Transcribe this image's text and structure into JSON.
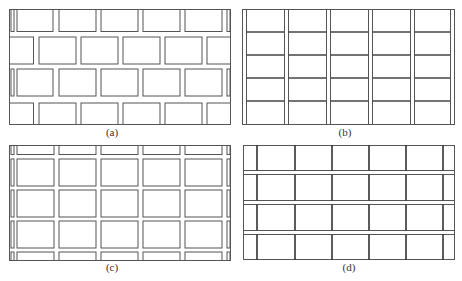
{
  "figure": {
    "panels": [
      {
        "id": "a",
        "label": "(a)",
        "pattern": "running-bond brick joints (staggered rows)"
      },
      {
        "id": "b",
        "label": "(b)",
        "pattern": "continuous vertical double joints, horizontal single joints"
      },
      {
        "id": "c",
        "label": "(c)",
        "pattern": "grid of separated rectangular blocks with double joints both directions"
      },
      {
        "id": "d",
        "label": "(d)",
        "pattern": "continuous horizontal double joints, thick vertical single joints"
      }
    ]
  },
  "colors": {
    "line": "#555555",
    "background": "#ffffff"
  }
}
